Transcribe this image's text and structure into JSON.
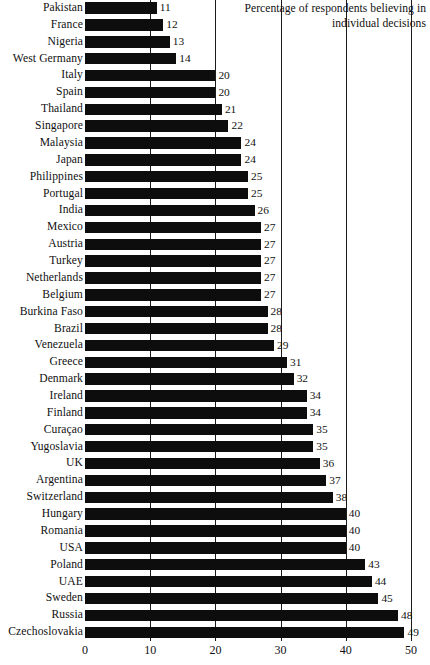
{
  "chart_data": {
    "type": "bar",
    "orientation": "horizontal",
    "title": "Percentage of respondents believing in individual decisions",
    "title_line1": "Percentage of respondents believing in",
    "title_line2": "individual decisions",
    "xlabel": "",
    "ylabel": "",
    "xlim": [
      0,
      50
    ],
    "grid": true,
    "grid_axis": "x",
    "legend": false,
    "xticks": [
      0,
      10,
      20,
      30,
      40,
      50
    ],
    "xtick_labels": [
      "0",
      "10",
      "20",
      "30",
      "40",
      "50"
    ],
    "bar_color": "#0d0d0d",
    "categories": [
      "Pakistan",
      "France",
      "Nigeria",
      "West Germany",
      "Italy",
      "Spain",
      "Thailand",
      "Singapore",
      "Malaysia",
      "Japan",
      "Philippines",
      "Portugal",
      "India",
      "Mexico",
      "Austria",
      "Turkey",
      "Netherlands",
      "Belgium",
      "Burkina Faso",
      "Brazil",
      "Venezuela",
      "Greece",
      "Denmark",
      "Ireland",
      "Finland",
      "Curaçao",
      "Yugoslavia",
      "UK",
      "Argentina",
      "Switzerland",
      "Hungary",
      "Romania",
      "USA",
      "Poland",
      "UAE",
      "Sweden",
      "Russia",
      "Czechoslovakia"
    ],
    "values": [
      11,
      12,
      13,
      14,
      20,
      20,
      21,
      22,
      24,
      24,
      25,
      25,
      26,
      27,
      27,
      27,
      27,
      27,
      28,
      28,
      29,
      31,
      32,
      34,
      34,
      35,
      35,
      36,
      37,
      38,
      40,
      40,
      40,
      43,
      44,
      45,
      48,
      49
    ],
    "value_labels": [
      "11",
      "12",
      "13",
      "14",
      "20",
      "20",
      "21",
      "22",
      "24",
      "24",
      "25",
      "25",
      "26",
      "27",
      "27",
      "27",
      "27",
      "27",
      "28",
      "28",
      "29",
      "31",
      "32",
      "34",
      "34",
      "35",
      "35",
      "36",
      "37",
      "38",
      "40",
      "40",
      "40",
      "43",
      "44",
      "45",
      "48",
      "49"
    ]
  }
}
